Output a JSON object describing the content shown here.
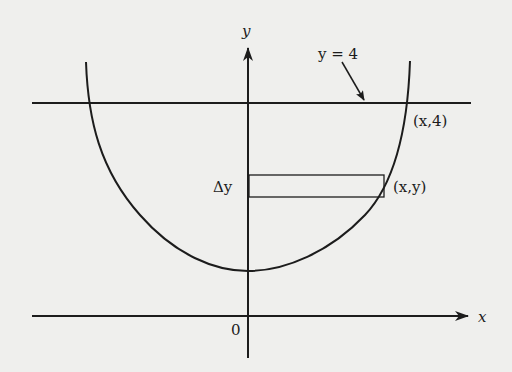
{
  "diagram": {
    "axes": {
      "x_label": "x",
      "y_label": "y",
      "origin_label": "0"
    },
    "line": {
      "label": "y = 4"
    },
    "points": {
      "top": "(x,4)",
      "strip": "(x,y)"
    },
    "strip": {
      "label": "Δy"
    },
    "colors": {
      "background": "#efefed",
      "ink": "#1c1c1c"
    }
  }
}
